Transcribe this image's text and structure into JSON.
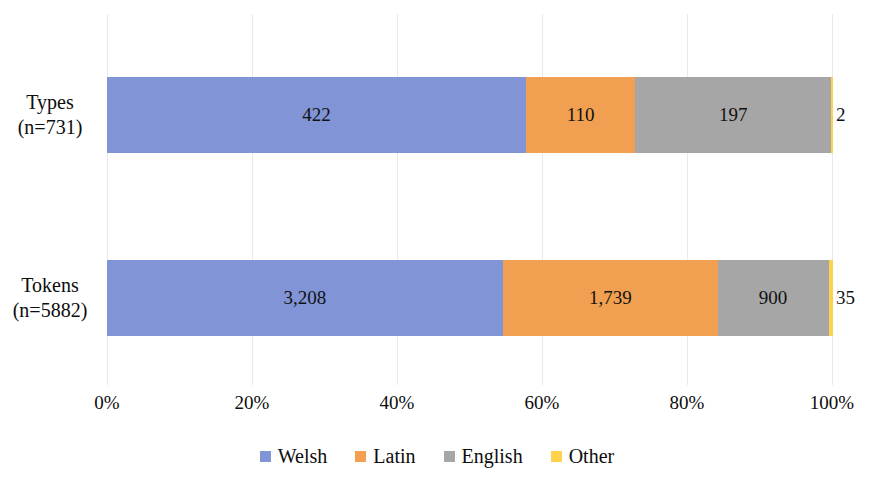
{
  "chart_data": {
    "type": "bar",
    "orientation": "horizontal",
    "stacked": true,
    "normalized": "percent",
    "title": "",
    "xlabel": "",
    "ylabel": "",
    "xlim": [
      0,
      100
    ],
    "grid": true,
    "legend_position": "bottom",
    "categories": [
      "Types\n(n=731)",
      "Tokens\n(n=5882)"
    ],
    "category_lines": [
      {
        "line1": "Types",
        "line2": "(n=731)",
        "total": 731
      },
      {
        "line1": "Tokens",
        "line2": "(n=5882)",
        "total": 5882
      }
    ],
    "xticks": [
      "0%",
      "20%",
      "40%",
      "60%",
      "80%",
      "100%"
    ],
    "xtick_values": [
      0,
      20,
      40,
      60,
      80,
      100
    ],
    "series": [
      {
        "name": "Welsh",
        "color": "#8094D6",
        "values": [
          422,
          3208
        ],
        "labels": [
          "422",
          "3,208"
        ],
        "percents": [
          57.73,
          54.54
        ]
      },
      {
        "name": "Latin",
        "color": "#F0A050",
        "values": [
          110,
          1739
        ],
        "labels": [
          "110",
          "1,739"
        ],
        "percents": [
          15.05,
          29.56
        ]
      },
      {
        "name": "English",
        "color": "#A6A6A6",
        "values": [
          197,
          900
        ],
        "labels": [
          "197",
          "900"
        ],
        "percents": [
          26.95,
          15.3
        ]
      },
      {
        "name": "Other",
        "color": "#FFD24D",
        "values": [
          2,
          35
        ],
        "labels": [
          "2",
          "35"
        ],
        "percents": [
          0.27,
          0.6
        ]
      }
    ]
  },
  "legend": {
    "items": [
      {
        "label": "Welsh",
        "color": "#8094D6"
      },
      {
        "label": "Latin",
        "color": "#F0A050"
      },
      {
        "label": "English",
        "color": "#A6A6A6"
      },
      {
        "label": "Other",
        "color": "#FFD24D"
      }
    ]
  },
  "axis": {
    "ticks": [
      {
        "label": "0%"
      },
      {
        "label": "20%"
      },
      {
        "label": "40%"
      },
      {
        "label": "60%"
      },
      {
        "label": "80%"
      },
      {
        "label": "100%"
      }
    ]
  },
  "bars": {
    "types": {
      "label_line1": "Types",
      "label_line2": "(n=731)",
      "segments": [
        {
          "name": "Welsh",
          "label": "422",
          "percent": 57.73
        },
        {
          "name": "Latin",
          "label": "110",
          "percent": 15.05
        },
        {
          "name": "English",
          "label": "197",
          "percent": 26.95
        },
        {
          "name": "Other",
          "label": "2",
          "percent": 0.27
        }
      ]
    },
    "tokens": {
      "label_line1": "Tokens",
      "label_line2": "(n=5882)",
      "segments": [
        {
          "name": "Welsh",
          "label": "3,208",
          "percent": 54.54
        },
        {
          "name": "Latin",
          "label": "1,739",
          "percent": 29.56
        },
        {
          "name": "English",
          "label": "900",
          "percent": 15.3
        },
        {
          "name": "Other",
          "label": "35",
          "percent": 0.6
        }
      ]
    }
  }
}
